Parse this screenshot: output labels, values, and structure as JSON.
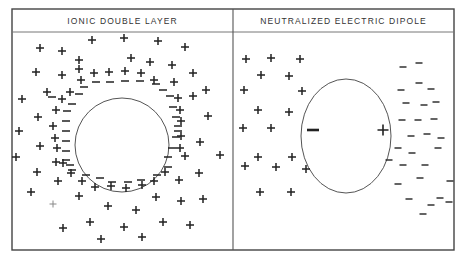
{
  "panels": [
    {
      "title": "IONIC DOUBLE LAYER",
      "circle": {
        "cx": 122,
        "cy": 145,
        "r": 47
      },
      "plus": [
        [
          40,
          48
        ],
        [
          62,
          51
        ],
        [
          92,
          40
        ],
        [
          124,
          38
        ],
        [
          158,
          41
        ],
        [
          185,
          47
        ],
        [
          79,
          60
        ],
        [
          131,
          58
        ],
        [
          150,
          62
        ],
        [
          172,
          65
        ],
        [
          36,
          72
        ],
        [
          62,
          75
        ],
        [
          79,
          69
        ],
        [
          81,
          80
        ],
        [
          94,
          73
        ],
        [
          109,
          72
        ],
        [
          125,
          71
        ],
        [
          141,
          73
        ],
        [
          154,
          80
        ],
        [
          174,
          82
        ],
        [
          193,
          73
        ],
        [
          47,
          92
        ],
        [
          70,
          92
        ],
        [
          62,
          99
        ],
        [
          22,
          99
        ],
        [
          206,
          90
        ],
        [
          193,
          96
        ],
        [
          178,
          98
        ],
        [
          56,
          110
        ],
        [
          38,
          117
        ],
        [
          53,
          126
        ],
        [
          180,
          110
        ],
        [
          181,
          121
        ],
        [
          208,
          116
        ],
        [
          55,
          138
        ],
        [
          181,
          136
        ],
        [
          19,
          131
        ],
        [
          200,
          142
        ],
        [
          16,
          157
        ],
        [
          40,
          146
        ],
        [
          57,
          148
        ],
        [
          180,
          148
        ],
        [
          56,
          162
        ],
        [
          185,
          156
        ],
        [
          220,
          155
        ],
        [
          37,
          172
        ],
        [
          63,
          163
        ],
        [
          71,
          173
        ],
        [
          58,
          181
        ],
        [
          82,
          181
        ],
        [
          95,
          187
        ],
        [
          111,
          186
        ],
        [
          126,
          188
        ],
        [
          142,
          185
        ],
        [
          154,
          181
        ],
        [
          165,
          172
        ],
        [
          179,
          180
        ],
        [
          199,
          173
        ],
        [
          203,
          199
        ],
        [
          31,
          192
        ],
        [
          79,
          196
        ],
        [
          156,
          197
        ],
        [
          181,
          201
        ],
        [
          108,
          206
        ],
        [
          136,
          210
        ],
        [
          63,
          228
        ],
        [
          90,
          222
        ],
        [
          124,
          227
        ],
        [
          163,
          222
        ],
        [
          190,
          225
        ],
        [
          101,
          239
        ],
        [
          142,
          237
        ]
      ],
      "plus_faint": [
        [
          53,
          204
        ]
      ],
      "minus": [
        [
          96,
          82
        ],
        [
          110,
          82
        ],
        [
          125,
          81
        ],
        [
          140,
          81
        ],
        [
          156,
          84
        ],
        [
          84,
          87
        ],
        [
          163,
          90
        ],
        [
          79,
          94
        ],
        [
          170,
          96
        ],
        [
          72,
          104
        ],
        [
          173,
          107
        ],
        [
          67,
          111
        ],
        [
          176,
          117
        ],
        [
          66,
          121
        ],
        [
          66,
          131
        ],
        [
          178,
          126
        ],
        [
          66,
          141
        ],
        [
          176,
          137
        ],
        [
          66,
          151
        ],
        [
          172,
          148
        ],
        [
          66,
          160
        ],
        [
          168,
          157
        ],
        [
          72,
          170
        ],
        [
          86,
          175
        ],
        [
          100,
          178
        ],
        [
          112,
          182
        ],
        [
          128,
          182
        ],
        [
          141,
          180
        ],
        [
          157,
          175
        ],
        [
          168,
          167
        ],
        [
          70,
          165
        ],
        [
          52,
          97
        ],
        [
          178,
          131
        ]
      ]
    },
    {
      "title": "NEUTRALIZED ELECTRIC DIPOLE",
      "circle": {
        "cx": 346,
        "cy": 136,
        "rx": 45,
        "ry": 57
      },
      "inner_minus": {
        "x": 313,
        "y": 130
      },
      "inner_plus": {
        "x": 383,
        "y": 130
      },
      "plus": [
        [
          246,
          59
        ],
        [
          271,
          58
        ],
        [
          300,
          59
        ],
        [
          261,
          75
        ],
        [
          289,
          76
        ],
        [
          244,
          90
        ],
        [
          302,
          91
        ],
        [
          258,
          110
        ],
        [
          289,
          112
        ],
        [
          243,
          128
        ],
        [
          271,
          128
        ],
        [
          258,
          157
        ],
        [
          292,
          157
        ],
        [
          245,
          166
        ],
        [
          276,
          167
        ],
        [
          306,
          169
        ],
        [
          260,
          192
        ],
        [
          291,
          192
        ]
      ],
      "minus": [
        [
          403,
          67
        ],
        [
          419,
          63
        ],
        [
          419,
          83
        ],
        [
          401,
          90
        ],
        [
          431,
          89
        ],
        [
          424,
          105
        ],
        [
          406,
          103
        ],
        [
          436,
          102
        ],
        [
          402,
          120
        ],
        [
          418,
          120
        ],
        [
          434,
          119
        ],
        [
          411,
          136
        ],
        [
          427,
          134
        ],
        [
          441,
          138
        ],
        [
          398,
          148
        ],
        [
          412,
          153
        ],
        [
          438,
          148
        ],
        [
          389,
          160
        ],
        [
          403,
          165
        ],
        [
          425,
          165
        ],
        [
          450,
          181
        ],
        [
          420,
          178
        ],
        [
          398,
          184
        ],
        [
          431,
          205
        ],
        [
          409,
          199
        ],
        [
          440,
          198
        ],
        [
          423,
          214
        ],
        [
          449,
          202
        ]
      ]
    }
  ]
}
